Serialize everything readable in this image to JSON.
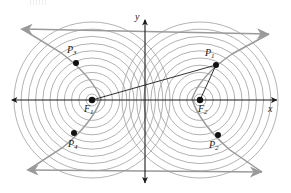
{
  "figure": {
    "type": "geometry-diagram",
    "width": 291,
    "height": 193,
    "background_color": "#ffffff"
  },
  "axes": {
    "x_label": "x",
    "y_label": "y",
    "x_axis": {
      "x1": 12,
      "y1": 100,
      "x2": 277,
      "y2": 100,
      "color": "#1a1a1a",
      "arrows": "both"
    },
    "y_axis": {
      "x1": 145,
      "y1": 20,
      "x2": 145,
      "y2": 183,
      "color": "#1a1a1a",
      "arrows": "both"
    },
    "x_label_pos": {
      "x": 268,
      "y": 104
    },
    "y_label_pos": {
      "x": 135,
      "y": 12
    }
  },
  "foci": [
    {
      "name": "F1",
      "letter": "F",
      "sub": "1",
      "cx": 92,
      "cy": 100,
      "label_x": 84,
      "label_y": 104
    },
    {
      "name": "F2",
      "letter": "F",
      "sub": "2",
      "cx": 200,
      "cy": 100,
      "label_x": 198,
      "label_y": 104
    }
  ],
  "points": [
    {
      "name": "P1",
      "letter": "P",
      "sub": "1",
      "cx": 216,
      "cy": 65,
      "label_x": 205,
      "label_y": 48
    },
    {
      "name": "P2",
      "letter": "P",
      "sub": "2",
      "cx": 218,
      "cy": 135,
      "label_x": 209,
      "label_y": 140
    },
    {
      "name": "P3",
      "letter": "P",
      "sub": "3",
      "cx": 76,
      "cy": 63,
      "label_x": 67,
      "label_y": 45
    },
    {
      "name": "P4",
      "letter": "P",
      "sub": "4",
      "cx": 74,
      "cy": 133,
      "label_x": 68,
      "label_y": 139
    }
  ],
  "circles": {
    "count_per_focus": 11,
    "inner_radius": 6,
    "radius_step": 7.2,
    "stroke_color": "#9e9e9e",
    "stroke_width": 0.8
  },
  "asymptotes": [
    {
      "name": "asymptote-upper",
      "x1": 22,
      "y1": 29,
      "x2": 269,
      "y2": 34,
      "color": "#9a9a9a"
    },
    {
      "name": "asymptote-lower",
      "x1": 28,
      "y1": 170,
      "x2": 262,
      "y2": 172,
      "color": "#9a9a9a"
    }
  ],
  "radii_segments": [
    {
      "name": "segment-F1-P1",
      "x1": 92,
      "y1": 100,
      "x2": 216,
      "y2": 65
    },
    {
      "name": "segment-F2-P1",
      "x1": 200,
      "y1": 100,
      "x2": 216,
      "y2": 65
    }
  ],
  "branch_curves": [
    {
      "name": "left-branch",
      "d": "M 22 29 L 60 52 Q 92 76 101 99 Q 92 124 62 148 L 28 170"
    },
    {
      "name": "right-branch",
      "d": "M 269 34 L 232 54 Q 200 76 192 99 Q 200 124 230 150 L 262 172"
    }
  ],
  "colors": {
    "ink": "#1a1a1a",
    "circle_gray": "#9e9e9e",
    "arrow_gray": "#9a9a9a",
    "point_fill": "#111111"
  }
}
